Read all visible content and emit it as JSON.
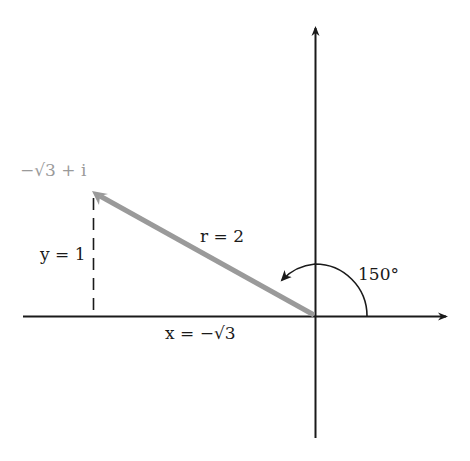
{
  "diagram": {
    "type": "complex-plane-polar-form",
    "point_label": "−√3 + i",
    "r_label": "r = 2",
    "y_label": "y = 1",
    "x_label": "x = −√3",
    "angle_label": "150°",
    "colors": {
      "axes": "#1a1a1a",
      "vector": "#9a9a9a",
      "point_label": "#9a9a9a",
      "text": "#1a1a1a"
    }
  }
}
